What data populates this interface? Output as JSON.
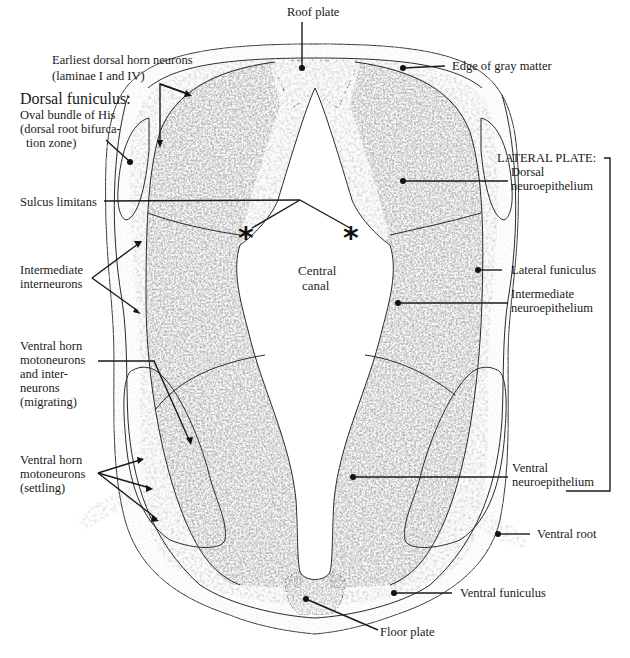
{
  "figure": {
    "colors": {
      "white_matter": "#efefef",
      "mantle": "#d6d6d6",
      "neuroepithelium": "#9c9c9c",
      "canal": "#ffffff",
      "line": "#2b2b2b",
      "root": "#dcdcdc"
    }
  },
  "labels": {
    "roof_plate": "Roof plate",
    "edge_gray_matter": "Edge of gray matter",
    "earliest_dorsal": [
      "Earliest dorsal horn neurons",
      "(laminae I and IV)"
    ],
    "dorsal_funiculus_title": "Dorsal funiculus:",
    "dorsal_funiculus_desc": [
      "Oval bundle of His",
      "(dorsal root bifurca-",
      "tion zone)"
    ],
    "sulcus_limitans": "Sulcus limitans",
    "intermediate_interneurons": [
      "Intermediate",
      "interneurons"
    ],
    "ventral_horn_migrating": [
      "Ventral horn",
      "motoneurons",
      "and inter-",
      "neurons",
      "(migrating)"
    ],
    "ventral_horn_settling": [
      "Ventral horn",
      "motoneurons",
      "(settling)"
    ],
    "central_canal": [
      "Central",
      "canal"
    ],
    "lateral_plate": "LATERAL PLATE:",
    "dorsal_neuroepithelium": [
      "Dorsal",
      "neuroepithelium"
    ],
    "lateral_funiculus": "Lateral funiculus",
    "intermediate_neuroepithelium": [
      "Intermediate",
      "neuroepithelium"
    ],
    "ventral_neuroepithelium": [
      "Ventral",
      "neuroepithelium"
    ],
    "ventral_root": "Ventral root",
    "ventral_funiculus": "Ventral funiculus",
    "floor_plate": "Floor plate",
    "sulcus_marker": "*"
  }
}
